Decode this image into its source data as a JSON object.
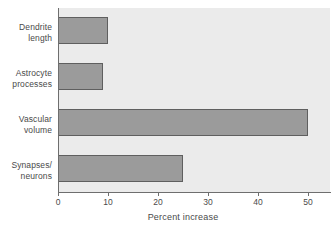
{
  "chart_data": {
    "type": "bar",
    "orientation": "horizontal",
    "title": "",
    "xlabel": "Percent increase",
    "ylabel": "",
    "categories": [
      "Dendrite length",
      "Astrocyte processes",
      "Vascular volume",
      "Synapses/ neurons"
    ],
    "category_lines": [
      [
        "Dendrite",
        "length"
      ],
      [
        "Astrocyte",
        "processes"
      ],
      [
        "Vascular",
        "volume"
      ],
      [
        "Synapses/",
        "neurons"
      ]
    ],
    "values": [
      10,
      9,
      50,
      25
    ],
    "xlim": [
      0,
      54.4
    ],
    "xticks": [
      0,
      10,
      20,
      30,
      40,
      50
    ],
    "xtick_labels": [
      "0",
      "10",
      "20",
      "30",
      "40",
      "50"
    ],
    "grid": false,
    "legend": null,
    "colors": {
      "bar_fill": "#9b9b9b",
      "bar_border": "#5f5f5f",
      "plot_background": "#ebebeb",
      "axis": "#6e6e6e",
      "text": "#4a4a4a",
      "figure_background": "#ffffff"
    }
  }
}
